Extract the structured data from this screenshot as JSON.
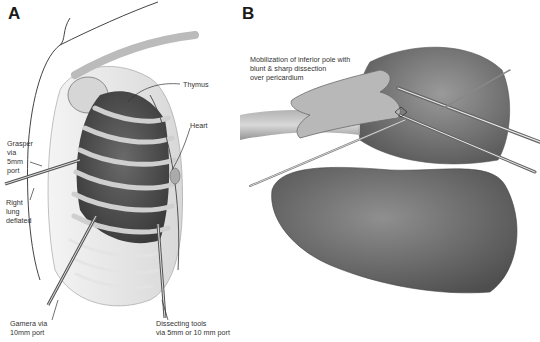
{
  "panels": [
    {
      "id": "A",
      "letter": "A",
      "labels": {
        "thymus": "Thymus",
        "heart": "Heart",
        "grasper": "Grasper\nvia\n5mm\nport",
        "right_lung": "Right\nlung\ndeflated",
        "camera": "Gamera via\n10mm port",
        "dissecting": "Dissecting tools\nvia 5mm or 10 mm port"
      }
    },
    {
      "id": "B",
      "letter": "B",
      "labels": {
        "mobilization": "Mobilization of inferior pole with\nblunt & sharp dissection\nover pericardium"
      }
    }
  ]
}
